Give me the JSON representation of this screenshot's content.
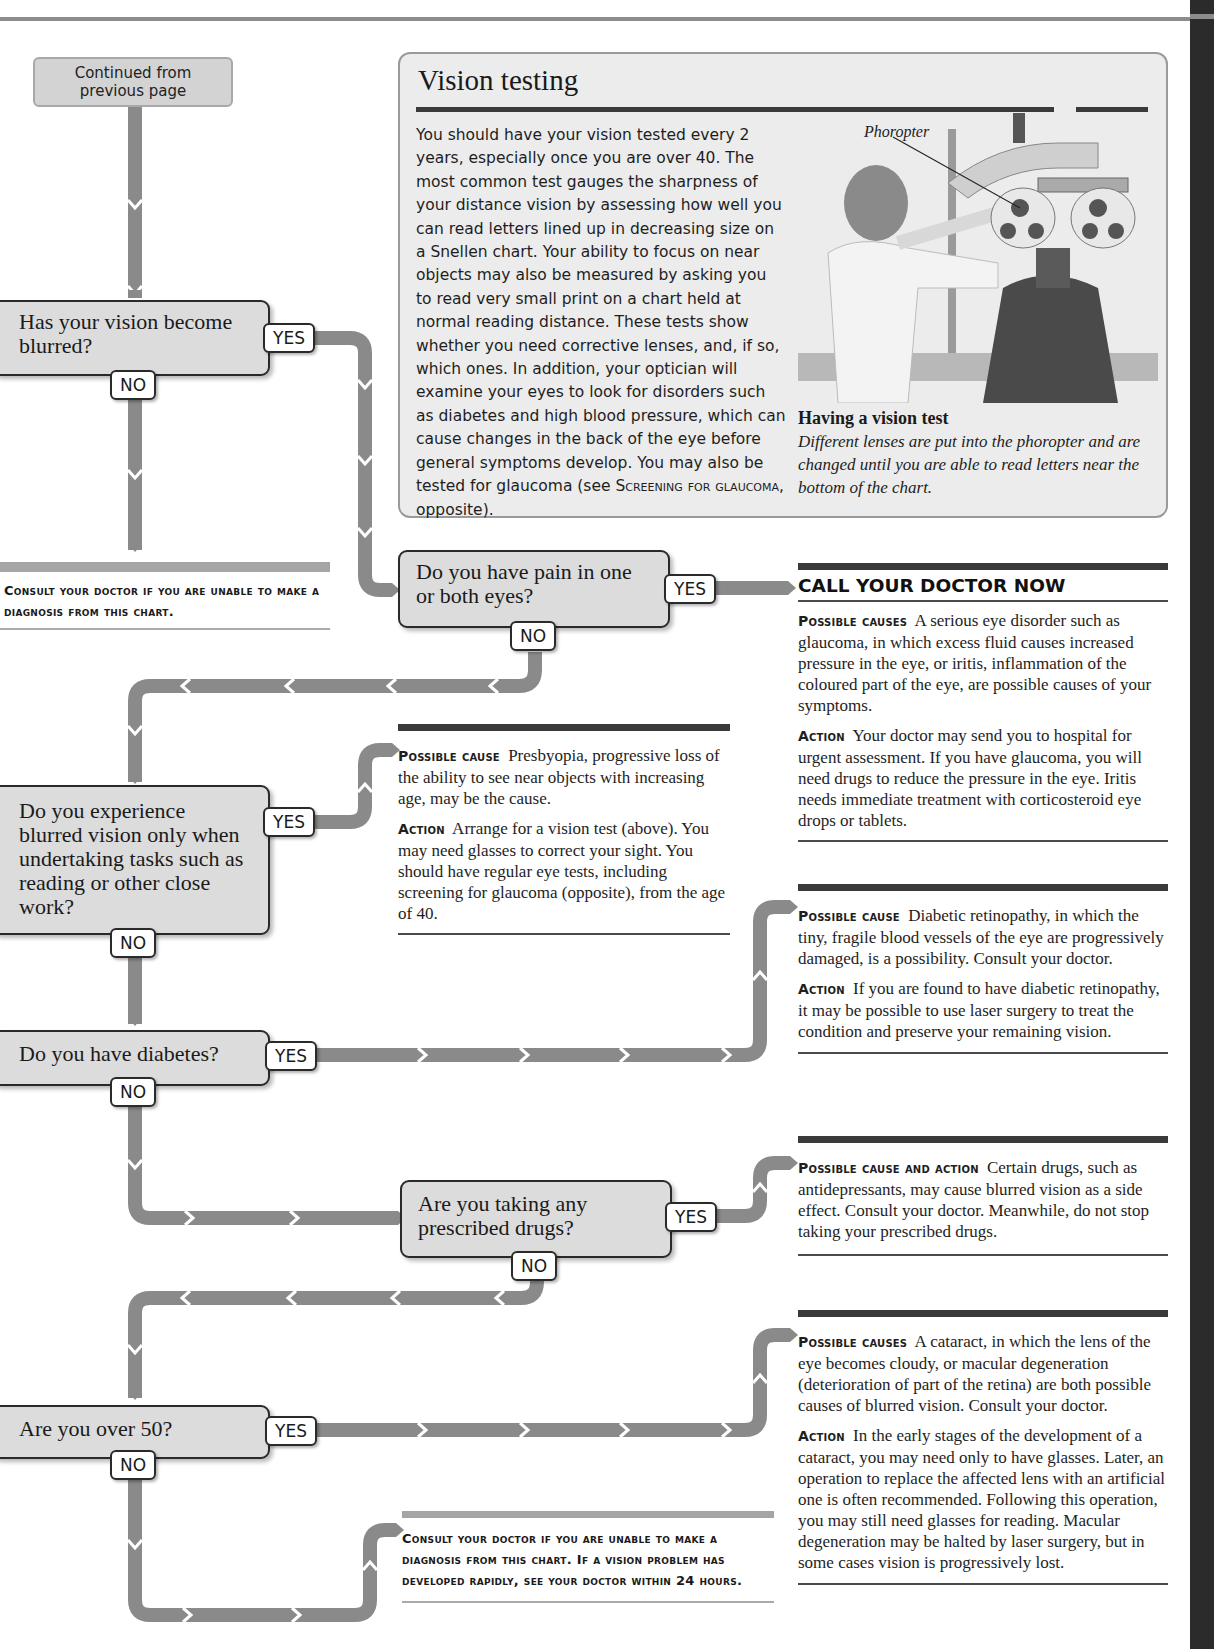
{
  "start": {
    "label": "Continued from previous page"
  },
  "vision_testing": {
    "title": "Vision testing",
    "body_before": "You should have your vision tested every 2 years, especially once you are over 40. The most common test gauges the sharpness of your distance vision by assessing how well you can read letters lined up in decreasing size on a Snellen chart. Your ability to focus on near objects may also be measured by asking you to read very small print on a chart held at normal reading distance. These tests show whether you need corrective lenses, and, if so, which ones. In addition, your optician will examine your eyes to look for disorders such as diabetes and high blood pressure, which can cause changes in the back of the eye before general symptoms develop. You may also be tested for glaucoma (see ",
    "body_ref": "Screening for glaucoma",
    "body_after": ", opposite).",
    "image_label": "Phoropter",
    "caption_title": "Having a vision test",
    "caption_body": "Different lenses are put into the phoropter and are changed until you are able to read letters near the bottom of the chart."
  },
  "questions": [
    {
      "id": "q1",
      "text": "Has your vision become blurred?",
      "yes": "YES",
      "no": "NO"
    },
    {
      "id": "q2",
      "text": "Do you have pain in one or both eyes?",
      "yes": "YES",
      "no": "NO"
    },
    {
      "id": "q3",
      "text": "Do you experience blurred vision only when undertaking tasks such as reading or other close work?",
      "yes": "YES",
      "no": "NO"
    },
    {
      "id": "q4",
      "text": "Do you have diabetes?",
      "yes": "YES",
      "no": "NO"
    },
    {
      "id": "q5",
      "text": "Are you taking any prescribed drugs?",
      "yes": "YES",
      "no": "NO"
    },
    {
      "id": "q6",
      "text": "Are you over 50?",
      "yes": "YES",
      "no": "NO"
    }
  ],
  "outcomes": {
    "consult_top": "Consult your doctor if you are unable to make a diagnosis from this chart.",
    "pain": {
      "heading": "CALL YOUR DOCTOR NOW",
      "cause_label": "Possible causes",
      "cause_text": "A serious eye disorder such as glaucoma, in which excess fluid causes increased pressure in the eye, or iritis, inflammation of the coloured part of the eye, are possible causes of your symptoms.",
      "action_label": "Action",
      "action_text": "Your doctor may send you to hospital for urgent assessment. If you have glaucoma, you will need drugs to reduce the pressure in the eye. Iritis needs immediate treatment with corticosteroid eye drops or tablets."
    },
    "presbyopia": {
      "cause_label": "Possible cause",
      "cause_text": "Presbyopia, progressive loss of the ability to see near objects with increasing age, may be the cause.",
      "action_label": "Action",
      "action_text": "Arrange for a vision test (above). You may need glasses to correct your sight. You should have regular eye tests, including screening for glaucoma (opposite), from the age of 40."
    },
    "diabetes": {
      "cause_label": "Possible cause",
      "cause_text": "Diabetic retinopathy, in which the tiny, fragile blood vessels of the eye are progressively damaged, is a possibility. Consult your doctor.",
      "action_label": "Action",
      "action_text": "If you are found to have diabetic retinopathy, it may be possible to use laser surgery to treat the condition and preserve your remaining vision."
    },
    "drugs": {
      "cause_label": "Possible cause and action",
      "cause_text": "Certain drugs, such as antidepressants, may cause blurred vision as a side effect. Consult your doctor. Meanwhile, do not stop taking your prescribed drugs."
    },
    "over50": {
      "cause_label": "Possible causes",
      "cause_text": "A cataract, in which the lens of the eye becomes cloudy, or macular degeneration (deterioration of part of the retina) are both possible causes of blurred vision. Consult your doctor.",
      "action_label": "Action",
      "action_text": "In the early stages of the development of a cataract, you may need only to have glasses. Later, an operation to replace the affected lens with an artificial one is often recommended. Following this operation, you may still need glasses for reading. Macular degeneration may be halted by laser surgery, but in some cases vision is progressively lost."
    },
    "consult_bottom": "Consult your doctor if you are unable to make a diagnosis from this chart. If a vision problem has developed rapidly, see your doctor within 24 hours."
  },
  "colors": {
    "connector": "#8a8a8a",
    "question_fill": "#dcdcdc",
    "question_border": "#2a2a2a",
    "panel_fill": "#ececec",
    "rule_dark": "#3a3a3a"
  }
}
